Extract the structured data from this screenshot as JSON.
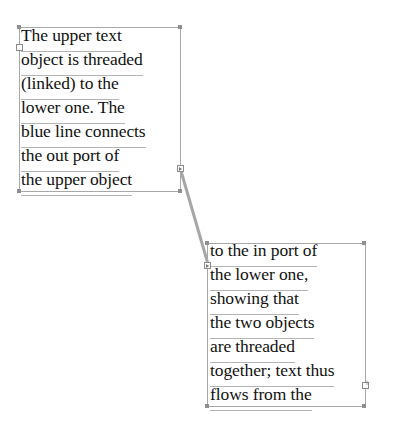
{
  "upper_text_object": {
    "lines": [
      "The upper text",
      "object is threaded",
      "(linked) to the",
      "lower one.  The",
      "blue line connects",
      "the out port of",
      "the upper object"
    ],
    "in_port": "empty",
    "out_port": "threaded"
  },
  "lower_text_object": {
    "lines": [
      "to the in port of",
      "the lower one,",
      "showing that",
      "the two objects",
      "are threaded",
      "together; text thus",
      "flows from the"
    ],
    "in_port": "threaded",
    "out_port": "overflow"
  },
  "thread_line": {
    "color": "#a0a0a0"
  }
}
